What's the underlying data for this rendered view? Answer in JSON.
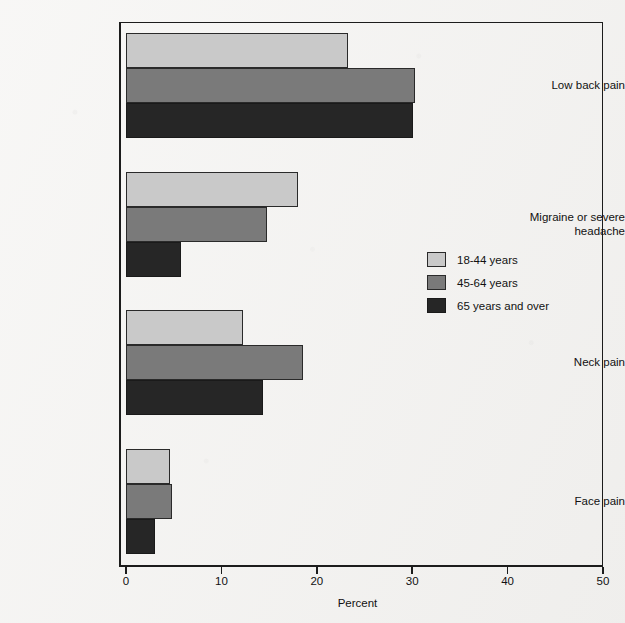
{
  "chart_data": {
    "type": "bar",
    "orientation": "horizontal",
    "title": "",
    "xlabel": "Percent",
    "ylabel": "",
    "xlim": [
      0,
      50
    ],
    "xticks": [
      "0",
      "10",
      "20",
      "30",
      "40",
      "50"
    ],
    "grid": false,
    "legend_position": "center-right",
    "categories": [
      "Low back pain",
      "Migraine or severe\nheadache",
      "Neck pain",
      "Face pain"
    ],
    "series": [
      {
        "name": "18-44 years",
        "color": "#c9c9c9",
        "values": [
          23.3,
          18.0,
          12.3,
          4.6
        ]
      },
      {
        "name": "45-64 years",
        "color": "#7a7a7a",
        "values": [
          30.3,
          14.8,
          18.6,
          4.8
        ]
      },
      {
        "name": "65 years and over",
        "color": "#262626",
        "values": [
          30.1,
          5.8,
          14.4,
          3.0
        ]
      }
    ]
  },
  "legend": {
    "items": [
      {
        "label": "18-44 years"
      },
      {
        "label": "45-64 years"
      },
      {
        "label": "65 years and over"
      }
    ]
  },
  "axis": {
    "x_title": "Percent",
    "x_tick_labels": [
      "0",
      "10",
      "20",
      "30",
      "40",
      "50"
    ]
  },
  "categories_labels": [
    "Low back pain",
    "Migraine or severe headache",
    "Neck pain",
    "Face pain"
  ]
}
